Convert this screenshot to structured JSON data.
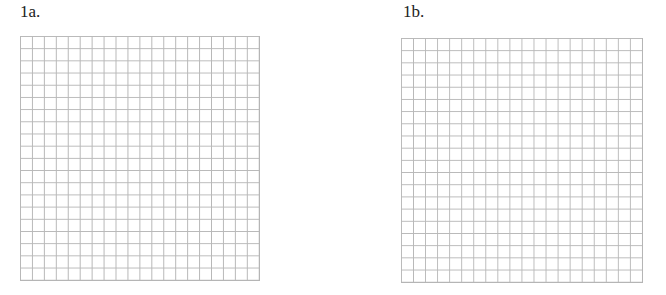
{
  "problems": [
    {
      "label": "1a.",
      "grid": {
        "columns": 20,
        "rows": 20
      }
    },
    {
      "label": "1b.",
      "grid": {
        "columns": 20,
        "rows": 20
      }
    }
  ],
  "colors": {
    "grid_line": "#b8b8b8",
    "label_text": "#222222",
    "background": "#ffffff"
  }
}
